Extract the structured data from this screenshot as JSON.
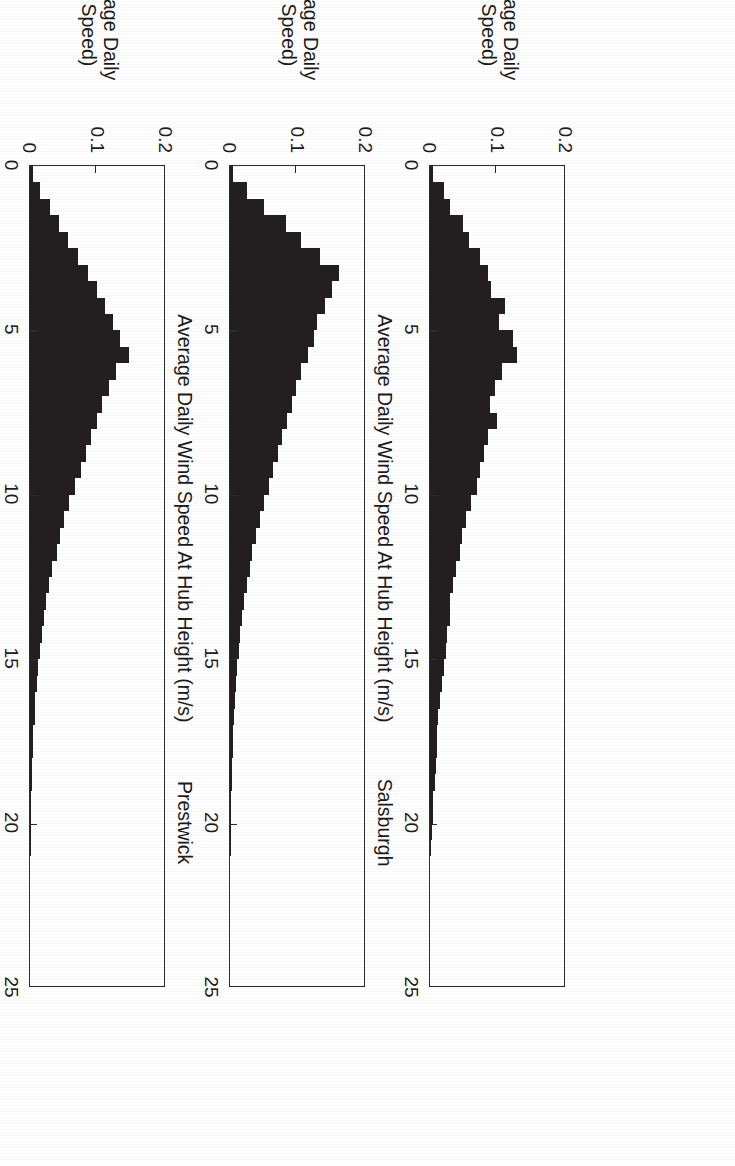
{
  "figure": {
    "shared_ylabel_line1": "P(Average Daily",
    "shared_ylabel_line2": "Wind Speed)",
    "shared_xlabel": "Average Daily Wind Speed At Hub Height (m/s)",
    "ink_color": "#231f20",
    "axis_color": "#2c2c2c",
    "background": "#ffffff"
  },
  "chart_data": {
    "type": "bar",
    "xlabel": "Average Daily Wind Speed At Hub Height (m/s)",
    "ylabel": "P(Average Daily Wind Speed)",
    "xlim": [
      0,
      25
    ],
    "ylim": [
      0,
      0.2
    ],
    "xticks": [
      0,
      5,
      10,
      15,
      20,
      25
    ],
    "xticklabels": [
      "0",
      "5",
      "10",
      "15",
      "20",
      "25"
    ],
    "yticks": [
      0,
      0.1,
      0.2
    ],
    "yticklabels": [
      "0",
      "0.1",
      "0.2"
    ],
    "grid": false,
    "legend": "none",
    "bin_width": 0.5,
    "bin_centers": [
      0.25,
      0.75,
      1.25,
      1.75,
      2.25,
      2.75,
      3.25,
      3.75,
      4.25,
      4.75,
      5.25,
      5.75,
      6.25,
      6.75,
      7.25,
      7.75,
      8.25,
      8.75,
      9.25,
      9.75,
      10.25,
      10.75,
      11.25,
      11.75,
      12.25,
      12.75,
      13.25,
      13.75,
      14.25,
      14.75,
      15.25,
      15.75,
      16.25,
      16.75,
      17.25,
      17.75,
      18.25,
      18.75,
      19.25,
      19.75,
      20.25,
      20.75
    ],
    "panels": [
      {
        "name": "salsburgh",
        "title": "Salsburgh",
        "values": [
          0.004,
          0.02,
          0.03,
          0.049,
          0.057,
          0.074,
          0.086,
          0.089,
          0.11,
          0.102,
          0.122,
          0.128,
          0.106,
          0.095,
          0.088,
          0.098,
          0.085,
          0.08,
          0.073,
          0.069,
          0.06,
          0.053,
          0.047,
          0.044,
          0.038,
          0.034,
          0.03,
          0.029,
          0.025,
          0.023,
          0.02,
          0.018,
          0.014,
          0.012,
          0.01,
          0.011,
          0.009,
          0.007,
          0.005,
          0.004,
          0.003,
          0.002
        ]
      },
      {
        "name": "prestwick",
        "title": "Prestwick",
        "values": [
          0.005,
          0.025,
          0.05,
          0.083,
          0.105,
          0.133,
          0.16,
          0.15,
          0.139,
          0.128,
          0.123,
          0.114,
          0.105,
          0.097,
          0.091,
          0.084,
          0.076,
          0.07,
          0.063,
          0.057,
          0.05,
          0.044,
          0.038,
          0.033,
          0.029,
          0.025,
          0.021,
          0.018,
          0.015,
          0.013,
          0.011,
          0.009,
          0.008,
          0.006,
          0.005,
          0.004,
          0.003,
          0.003,
          0.002,
          0.002,
          0.001,
          0.001
        ]
      },
      {
        "name": "leuchars",
        "title": "Leuchars",
        "values": [
          0.004,
          0.014,
          0.03,
          0.043,
          0.056,
          0.07,
          0.085,
          0.098,
          0.11,
          0.122,
          0.133,
          0.145,
          0.126,
          0.116,
          0.106,
          0.098,
          0.09,
          0.083,
          0.075,
          0.066,
          0.058,
          0.05,
          0.044,
          0.039,
          0.033,
          0.028,
          0.024,
          0.02,
          0.017,
          0.014,
          0.012,
          0.01,
          0.008,
          0.007,
          0.005,
          0.004,
          0.003,
          0.003,
          0.002,
          0.002,
          0.001,
          0.001
        ]
      }
    ]
  }
}
